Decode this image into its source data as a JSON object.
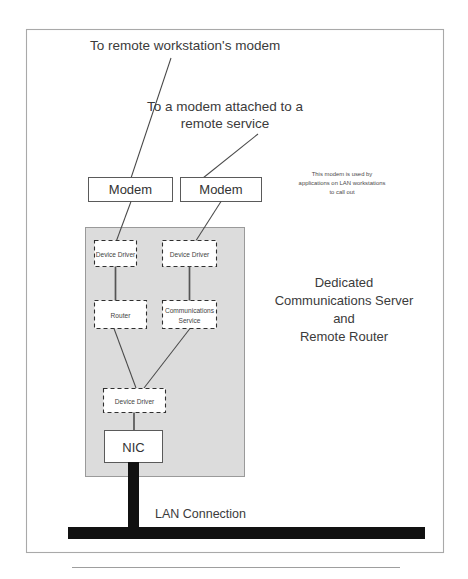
{
  "figure": {
    "title_top": "To remote workstation's modem",
    "title_mid_line1": "To a modem attached to a",
    "title_mid_line2": "remote service",
    "note_line1": "This modem is used by",
    "note_line2": "applications on LAN workstations",
    "note_line3": "to call out",
    "side_caption_line1": "Dedicated",
    "side_caption_line2": "Communications Server",
    "side_caption_line3": "and",
    "side_caption_line4": "Remote Router",
    "lan_label": "LAN Connection"
  },
  "boxes": {
    "modem_left": "Modem",
    "modem_right": "Modem",
    "device_driver_left": "Device Driver",
    "device_driver_right": "Device Driver",
    "router": "Router",
    "comms_service_line1": "Communications",
    "comms_service_line2": "Service",
    "device_driver_bottom": "Device Driver",
    "nic": "NIC"
  },
  "colors": {
    "host_fill": "#dcdcdc",
    "frame_stroke": "#a9a9a9",
    "bus_black": "#111111",
    "text": "#3b3b3b"
  }
}
